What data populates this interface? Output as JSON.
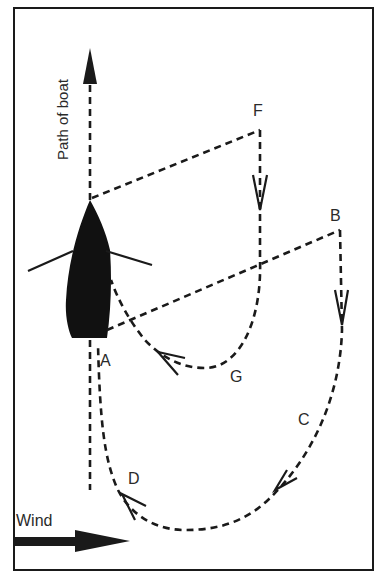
{
  "diagram": {
    "path_label": "Path of boat",
    "wind_label": "Wind",
    "points": {
      "A": "A",
      "B": "B",
      "C": "C",
      "D": "D",
      "F": "F",
      "G": "G"
    },
    "colors": {
      "ink": "#1a1a1a",
      "background": "#ffffff"
    }
  }
}
